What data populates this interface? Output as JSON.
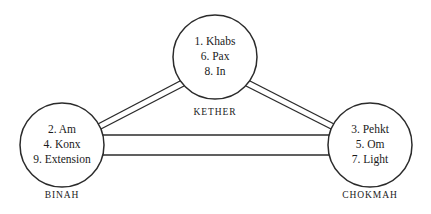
{
  "diagram": {
    "background_color": "#ffffff",
    "stroke_color": "#2b2b2b",
    "text_color": "#1a1a1a",
    "nodes": [
      {
        "id": "kether",
        "caption": "KETHER",
        "lines": [
          "1. Khabs",
          "6. Pax",
          "8. In"
        ],
        "cx": 215,
        "cy": 57,
        "r": 42
      },
      {
        "id": "binah",
        "caption": "BINAH",
        "lines": [
          "2. Am",
          "4. Konx",
          "9. Extension"
        ],
        "cx": 62,
        "cy": 145,
        "r": 42
      },
      {
        "id": "chokmah",
        "caption": "CHOKMAH",
        "lines": [
          "3. Pehkt",
          "5. Om",
          "7. Light"
        ],
        "cx": 370,
        "cy": 145,
        "r": 42
      }
    ],
    "edges": [
      {
        "id": "binah-kether",
        "from": "binah",
        "to": "kether",
        "style": "double-line"
      },
      {
        "id": "kether-chokmah",
        "from": "kether",
        "to": "chokmah",
        "style": "double-line"
      },
      {
        "id": "binah-chokmah",
        "from": "binah",
        "to": "chokmah",
        "style": "double-line"
      }
    ]
  }
}
